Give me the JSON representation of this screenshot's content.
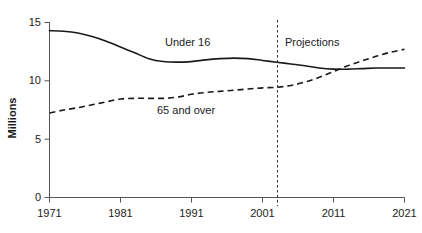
{
  "chart_data": {
    "type": "line",
    "title": "",
    "xlabel": "",
    "ylabel": "Millions",
    "xlim": [
      1971,
      2021
    ],
    "ylim": [
      0,
      15
    ],
    "yticks": [
      0,
      5,
      10,
      15
    ],
    "xticks": [
      1971,
      1981,
      1991,
      2001,
      2011,
      2021
    ],
    "grid": false,
    "legend_position": "inline-annotations",
    "annotations": [
      {
        "text": "Under 16",
        "x": 1995,
        "y": 13.2
      },
      {
        "text": "65 and over",
        "x": 1992,
        "y": 7.9
      },
      {
        "text": "Projections",
        "x": 2008,
        "y": 13.2
      }
    ],
    "projection_divider": {
      "x": 2003.5,
      "style": "dashed",
      "label": "Projections"
    },
    "series": [
      {
        "name": "Under 16",
        "style": "solid",
        "x": [
          1971,
          1973,
          1975,
          1977,
          1979,
          1981,
          1983,
          1985,
          1987,
          1989,
          1991,
          1993,
          1995,
          1997,
          1999,
          2001,
          2003,
          2005,
          2007,
          2009,
          2011,
          2013,
          2015,
          2017,
          2019,
          2021
        ],
        "values": [
          14.3,
          14.25,
          14.1,
          13.8,
          13.4,
          12.9,
          12.4,
          11.9,
          11.65,
          11.6,
          11.65,
          11.8,
          11.9,
          11.95,
          11.9,
          11.75,
          11.6,
          11.45,
          11.3,
          11.1,
          11.0,
          11.0,
          11.05,
          11.1,
          11.1,
          11.1
        ]
      },
      {
        "name": "65 and over",
        "style": "dashed",
        "x": [
          1971,
          1973,
          1975,
          1977,
          1979,
          1981,
          1983,
          1985,
          1987,
          1989,
          1991,
          1993,
          1995,
          1997,
          1999,
          2001,
          2003,
          2005,
          2007,
          2009,
          2011,
          2013,
          2015,
          2017,
          2019,
          2021
        ],
        "values": [
          7.25,
          7.5,
          7.7,
          7.95,
          8.2,
          8.45,
          8.5,
          8.5,
          8.5,
          8.6,
          8.85,
          9.0,
          9.1,
          9.2,
          9.3,
          9.4,
          9.45,
          9.6,
          9.9,
          10.3,
          10.8,
          11.3,
          11.7,
          12.1,
          12.45,
          12.7
        ]
      }
    ]
  },
  "axis": {
    "y_tick_labels": [
      "15",
      "10",
      "5",
      "0"
    ],
    "x_tick_labels": [
      "1971",
      "1981",
      "1991",
      "2001",
      "2011",
      "2021"
    ],
    "y_axis_title": "Millions"
  }
}
